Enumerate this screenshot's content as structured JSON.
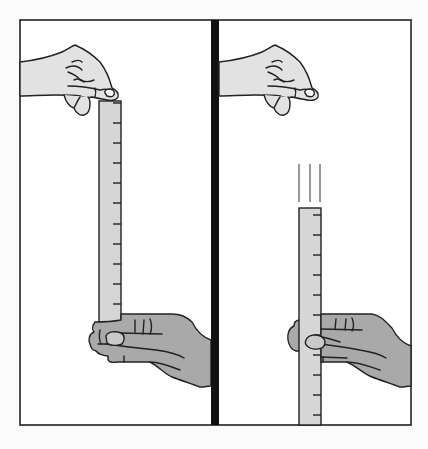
{
  "figure": {
    "panels": [
      {
        "id": "before-drop",
        "description": "Top hand holds ruler by its upper end; bottom hand waits with fingers open around the ruler's lower end",
        "ruler_ticks": 12
      },
      {
        "id": "after-release",
        "description": "Top hand has released ruler; ruler falls (motion lines) and bottom hand catches it",
        "ruler_ticks": 11,
        "motion_lines": 3
      }
    ],
    "colors": {
      "background": "#fbfbfb",
      "panel_fill": "#ffffff",
      "outline": "#222222",
      "divider": "#111111",
      "top_hand": "#e2e2e2",
      "bottom_hand": "#a9a9a9",
      "ruler": "#d6d6d6"
    }
  }
}
